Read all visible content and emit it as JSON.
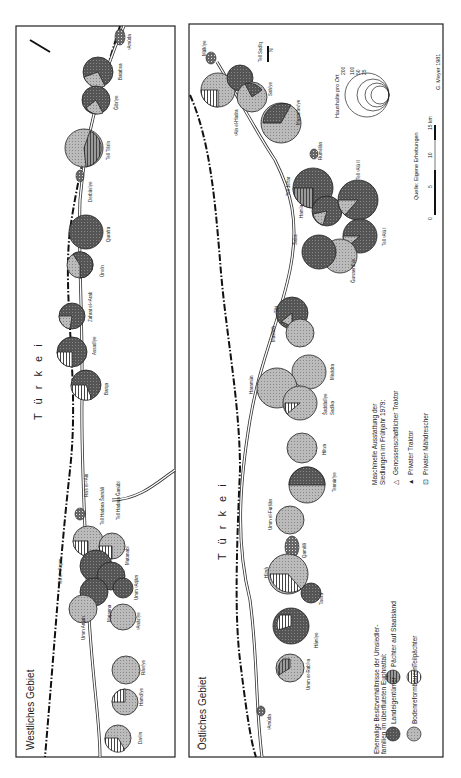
{
  "panels": {
    "west": {
      "title": "Westliches Gebiet",
      "country": "T ü r k e i"
    },
    "east": {
      "title": "Östliches Gebiet",
      "country": "T ü r k e i"
    }
  },
  "legend": {
    "ownership_title_1": "Ehemalige Besitzverhältnisse der Umsiedler-",
    "ownership_title_2": "familien im überfluteten Euphrattal:",
    "categories": [
      {
        "label": "Landeigentümer",
        "pattern": "dark"
      },
      {
        "label": "Bodenreformbauern",
        "pattern": "light"
      },
      {
        "label": "Pächter auf Staatsland",
        "pattern": "hatch"
      },
      {
        "label": "Teilpächter",
        "pattern": "vertical"
      }
    ],
    "equipment_title_1": "Maschinelle Ausstattung der",
    "equipment_title_2": "Siedlungen im Frühjahr 1979:",
    "equipment": [
      {
        "symbol": "△",
        "label": "Genossenschaftlicher Traktor"
      },
      {
        "symbol": "▲",
        "label": "Privater Traktor"
      },
      {
        "symbol": "⊡",
        "label": "Privater Mähdrescher"
      }
    ],
    "size_title": "Haushalte pro Ort",
    "sizes": [
      "200",
      "100",
      "50",
      "25"
    ],
    "scale": {
      "ticks": [
        "0",
        "5",
        "10",
        "15 km"
      ]
    },
    "source": "Quelle: Eigene Erhebungen",
    "author": "G. Meyer 1981",
    "north": "N"
  },
  "places_west": [
    "Daᶜīm",
    "Hamdīye",
    "Rāwīye",
    "Umm Arqan",
    "Majanna",
    "Tell el-ᶜArqan",
    "ᶜAnāzīye",
    "Umm ᶜArjām",
    "Mutanabi",
    "Tell Hadara Šamāli",
    "Tell Hadara Ğanūbi",
    "Ra's el-ᶜAin",
    "Barqa",
    "Assadīye",
    "Zahrat el-ᶜArab",
    "Ūrwīn",
    "Qurafra",
    "Derbāsīye",
    "Tell Tišrīn",
    "Ğibrīye",
    "Batabsa",
    "ᶜAmūda"
  ],
  "places_east": [
    "ᶜAmūda",
    "Umm er-Rabīᶜa",
    "Hāmīye",
    "Tawra",
    "Hīmā",
    "Qamišli",
    "Umm el-Furšān",
    "Tennūrīye",
    "Hilwa",
    "Šaddādīye",
    "Sadīka",
    "Haramūn",
    "Misādra",
    "Mašhūh",
    "Tibi",
    "Ğuwaerdīye",
    "Šaba",
    "Hamīa",
    "Tell ᶜAlū I",
    "Tell Jeffar",
    "Tell ᶜAlū II",
    "Rumēlān",
    "Mustafāwīye",
    "ᶜAin el-Hadra",
    "Sahīye",
    "Tell Sadīq",
    "Mālkīye"
  ]
}
